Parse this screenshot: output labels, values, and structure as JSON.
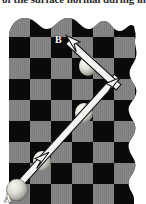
{
  "figure": {
    "caption_clipped": "of the surface normal during im",
    "labels": {
      "start_point": "A",
      "end_point": "B"
    },
    "colors": {
      "light_square": "#878787",
      "dark_square": "#0a0a0a",
      "page_background": "#ffffff",
      "arrow_fill": "#f2f2f2",
      "arrow_stroke": "#111111",
      "ball_light": "#f0f0ea",
      "ball_mid": "#c9c9c2",
      "ball_shadow": "#6e6e68",
      "label_text": "#ffffff"
    },
    "board": {
      "columns": 7,
      "rows": 9,
      "cell_size": 21,
      "origin_x": 9,
      "origin_y": 16,
      "edge_style": "torn-wavy",
      "torn_edges": [
        "top",
        "right"
      ]
    },
    "trajectory": {
      "type": "bouncing-reflection",
      "segments": [
        {
          "name": "incoming",
          "from": [
            16,
            193
          ],
          "to": [
            117,
            82
          ],
          "has_arrowheads": true
        },
        {
          "name": "outgoing",
          "from": [
            117,
            82
          ],
          "to": [
            67,
            36
          ],
          "has_arrowheads": true
        }
      ],
      "vertex": [
        117,
        82
      ],
      "arrowhead_count": 3,
      "arrowhead_positions": [
        [
          67,
          36
        ],
        [
          112,
          89
        ],
        [
          42,
          161
        ]
      ]
    },
    "balls": [
      {
        "name": "ball-at-A",
        "cx": 17,
        "cy": 190,
        "r": 10
      },
      {
        "name": "ball-mid-incoming",
        "cx": 42,
        "cy": 161,
        "r": 9
      },
      {
        "name": "ball-upper-incoming",
        "cx": 84,
        "cy": 113,
        "r": 9
      },
      {
        "name": "ball-outgoing",
        "cx": 88,
        "cy": 66,
        "r": 9
      }
    ]
  }
}
